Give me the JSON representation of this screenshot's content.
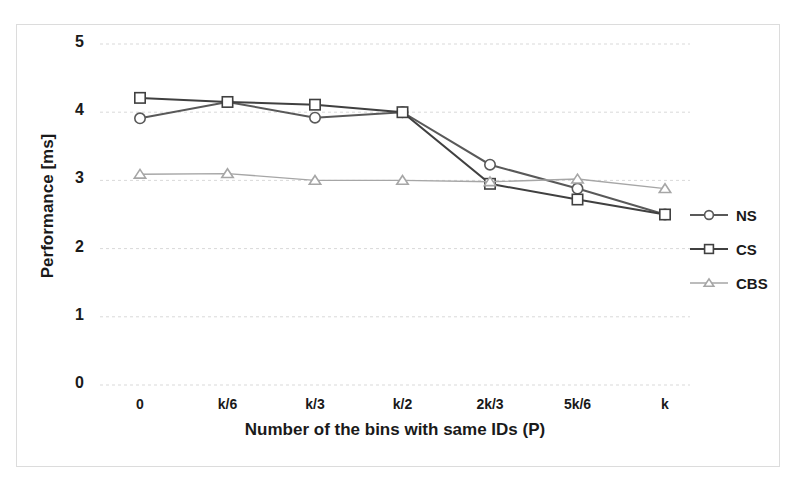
{
  "chart_data": {
    "type": "line",
    "title": "",
    "xlabel": "Number of the bins with same IDs (P)",
    "ylabel": "Performance [ms]",
    "categories": [
      "0",
      "k/6",
      "k/3",
      "k/2",
      "2k/3",
      "5k/6",
      "k"
    ],
    "ylim": [
      0,
      5
    ],
    "yticks": [
      "0",
      "1",
      "2",
      "3",
      "4",
      "5"
    ],
    "grid": true,
    "legend_position": "right",
    "series": [
      {
        "name": "NS",
        "marker": "circle",
        "color": "#595959",
        "values": [
          3.91,
          4.15,
          3.92,
          4.0,
          3.23,
          2.88,
          2.5
        ]
      },
      {
        "name": "CS",
        "marker": "square",
        "color": "#404040",
        "values": [
          4.21,
          4.15,
          4.11,
          4.0,
          2.95,
          2.72,
          2.5
        ]
      },
      {
        "name": "CBS",
        "marker": "triangle",
        "color": "#a6a6a6",
        "values": [
          3.09,
          3.1,
          3.0,
          3.0,
          2.98,
          3.02,
          2.88
        ]
      }
    ]
  },
  "colors": {
    "frame": "#dcdcdc",
    "grid": "#d9d9d9",
    "text": "#1a1a1a",
    "background": "#ffffff"
  }
}
